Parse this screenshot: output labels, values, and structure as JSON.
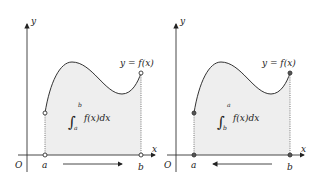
{
  "panels": [
    {
      "id": "left",
      "axis_x_label": "x",
      "axis_y_label": "y",
      "origin_label": "O",
      "point_a_label": "a",
      "point_b_label": "b",
      "curve_label": "y = f(x)",
      "integral": {
        "symbol": "∫",
        "lower": "a",
        "upper": "b",
        "integrand": "f(x)dx"
      },
      "direction": "right"
    },
    {
      "id": "right",
      "axis_x_label": "x",
      "axis_y_label": "y",
      "origin_label": "O",
      "point_a_label": "a",
      "point_b_label": "b",
      "curve_label": "y = f(x)",
      "integral": {
        "symbol": "∫",
        "lower": "b",
        "upper": "a",
        "integrand": "f(x)dx"
      },
      "direction": "left"
    }
  ],
  "colors": {
    "fill": "#eeeeee",
    "stroke": "#333333"
  }
}
